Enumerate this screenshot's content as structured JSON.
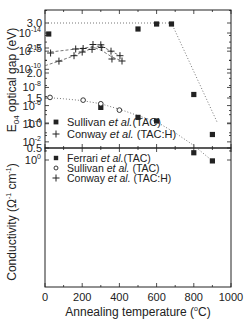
{
  "chart_data": [
    {
      "type": "scatter",
      "panel": "top",
      "title": "",
      "xlabel": "Annealing temperature (°C)",
      "ylabel": "E04 optical gap (eV)",
      "xlim": [
        0,
        1000
      ],
      "ylim": [
        0.5,
        3.25
      ],
      "yticks": [
        0.5,
        1.0,
        1.5,
        2.0,
        2.5,
        3.0
      ],
      "ytick_labels": [
        "0.5",
        "1.0",
        "1.5",
        "2.0",
        "2.5",
        "3.0"
      ],
      "grid": false,
      "legend_position": "lower left",
      "series": [
        {
          "name": "Sullivan et al.(TAC)",
          "marker": "square-filled",
          "x": [
            20,
            500,
            600,
            680,
            800,
            900
          ],
          "y": [
            2.78,
            2.88,
            2.98,
            2.98,
            1.57,
            0.77
          ]
        },
        {
          "name": "Conway et al. (TAC:H)",
          "marker": "plus",
          "x": [
            30,
            165,
            205,
            258,
            305,
            360,
            414
          ],
          "y": [
            2.4,
            2.48,
            2.49,
            2.57,
            2.51,
            2.28,
            2.24
          ]
        }
      ],
      "guide_lines": [
        {
          "style": "dotted",
          "x": [
            0,
            680,
            925
          ],
          "y": [
            3.0,
            3.0,
            1.02
          ]
        },
        {
          "style": "dashed",
          "x": [
            30,
            165,
            205,
            258,
            305,
            360,
            414
          ],
          "y": [
            2.42,
            2.48,
            2.5,
            2.52,
            2.45,
            2.32,
            2.24
          ]
        }
      ]
    },
    {
      "type": "scatter",
      "panel": "bottom",
      "title": "",
      "xlabel": "Annealing temperature (°C)",
      "ylabel": "Conductivity (Ω⁻¹ cm⁻¹)",
      "yscale": "log",
      "xlim": [
        0,
        1000
      ],
      "ylim_log10": [
        -14,
        0.7
      ],
      "xticks": [
        0,
        200,
        400,
        600,
        800,
        1000
      ],
      "xtick_labels": [
        "0",
        "200",
        "400",
        "600",
        "800",
        "1000"
      ],
      "yticks_log10": [
        0,
        -2,
        -4,
        -6,
        -8,
        -10,
        -12,
        -14
      ],
      "grid": false,
      "legend_position": "upper left",
      "series": [
        {
          "name": "Ferrari et al.(TAC)",
          "marker": "square-filled",
          "x": [
            300,
            500,
            600,
            800,
            900
          ],
          "log10_y": [
            -5.8,
            -4.7,
            -4.3,
            -0.8,
            0.1
          ]
        },
        {
          "name": "Sullivan et al. (TAC)",
          "marker": "circle-open",
          "x": [
            27,
            205,
            300,
            400
          ],
          "log10_y": [
            -6.9,
            -6.6,
            -6.2,
            -5.5
          ]
        },
        {
          "name": "Conway et al. (TAC:H)",
          "marker": "plus",
          "x": [
            75,
            156,
            200,
            253,
            300,
            355,
            403
          ],
          "log10_y": [
            -10.9,
            -11.5,
            -11.9,
            -12.2,
            -12.7,
            -12.0,
            -11.5
          ]
        }
      ],
      "guide_lines": [
        {
          "style": "dotted",
          "x": [
            0,
            100,
            200,
            300,
            400,
            500,
            600,
            700,
            800,
            900
          ],
          "log10_y": [
            -6.9,
            -6.75,
            -6.55,
            -6.2,
            -5.6,
            -4.9,
            -4.2,
            -3.0,
            -1.6,
            0.1
          ]
        },
        {
          "style": "dashed",
          "x": [
            0,
            75,
            156,
            200,
            253,
            300,
            355,
            403
          ],
          "log10_y": [
            -10.4,
            -10.9,
            -11.5,
            -11.9,
            -12.3,
            -12.6,
            -12.0,
            -11.5
          ]
        }
      ]
    }
  ],
  "axes": {
    "top_ylabel_main": "E",
    "top_ylabel_sub": "04",
    "top_ylabel_rest": " optical gap (eV)",
    "bottom_ylabel_main": "Conductivity (Ω",
    "bottom_ylabel_sup1": "-1",
    "bottom_ylabel_mid": "cm",
    "bottom_ylabel_sup2": "-1",
    "bottom_ylabel_end": ")",
    "xlabel_main": "Annealing temperature (",
    "xlabel_sup": "o",
    "xlabel_end": "C)"
  },
  "legend_top": [
    {
      "marker": "square-filled",
      "name_a": "Sullivan ",
      "name_b": "et al.",
      "name_c": "(TAC)"
    },
    {
      "marker": "plus",
      "name_a": "Conway ",
      "name_b": "et al.",
      "name_c": " (TAC:H)"
    }
  ],
  "legend_bottom": [
    {
      "marker": "square-filled",
      "name_a": "Ferrari ",
      "name_b": "et al.",
      "name_c": "(TAC)"
    },
    {
      "marker": "circle-open",
      "name_a": "Sullivan ",
      "name_b": "et al.",
      "name_c": " (TAC)"
    },
    {
      "marker": "plus",
      "name_a": "Conway ",
      "name_b": "et al.",
      "name_c": " (TAC:H)"
    }
  ],
  "colors": {
    "ink": "#222222",
    "guide": "#666666",
    "background": "#ffffff"
  }
}
